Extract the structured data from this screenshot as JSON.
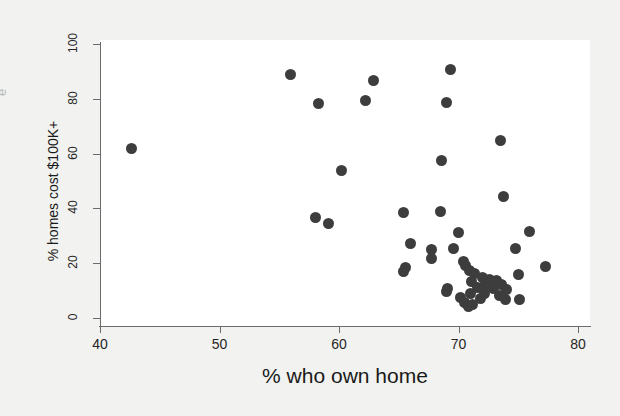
{
  "figure": {
    "clipped_left_text": "e",
    "background_color": "#f2f2f0",
    "plot_background_color": "#ffffff",
    "axis_color": "#6b6b6b",
    "marker_color": "#3d3d3d"
  },
  "chart_data": {
    "type": "scatter",
    "title": "",
    "xlabel": "% who own home",
    "ylabel": "% homes cost $100K+",
    "xlim": [
      40,
      80
    ],
    "ylim": [
      0,
      100
    ],
    "xticks": [
      40,
      50,
      60,
      70,
      80
    ],
    "yticks": [
      0,
      20,
      40,
      60,
      80,
      100
    ],
    "grid": false,
    "legend": "none",
    "marker": "filled-circle",
    "n_points": 51,
    "points": [
      {
        "x": 42.6,
        "y": 61.8
      },
      {
        "x": 55.9,
        "y": 88.7
      },
      {
        "x": 58.3,
        "y": 78.3
      },
      {
        "x": 62.2,
        "y": 79.2
      },
      {
        "x": 62.9,
        "y": 86.8
      },
      {
        "x": 69.3,
        "y": 90.8
      },
      {
        "x": 69.0,
        "y": 78.6
      },
      {
        "x": 73.5,
        "y": 64.7
      },
      {
        "x": 68.6,
        "y": 57.4
      },
      {
        "x": 60.2,
        "y": 53.9
      },
      {
        "x": 73.8,
        "y": 44.2
      },
      {
        "x": 65.4,
        "y": 38.5
      },
      {
        "x": 68.5,
        "y": 38.7
      },
      {
        "x": 58.0,
        "y": 36.6
      },
      {
        "x": 59.1,
        "y": 34.6
      },
      {
        "x": 70.0,
        "y": 31.3
      },
      {
        "x": 75.9,
        "y": 31.5
      },
      {
        "x": 66.0,
        "y": 27.2
      },
      {
        "x": 69.6,
        "y": 25.3
      },
      {
        "x": 67.7,
        "y": 25.0
      },
      {
        "x": 74.8,
        "y": 25.2
      },
      {
        "x": 67.7,
        "y": 21.8
      },
      {
        "x": 70.4,
        "y": 20.7
      },
      {
        "x": 70.6,
        "y": 19.2
      },
      {
        "x": 65.6,
        "y": 18.6
      },
      {
        "x": 77.3,
        "y": 18.7
      },
      {
        "x": 65.4,
        "y": 17.1
      },
      {
        "x": 70.9,
        "y": 17.3
      },
      {
        "x": 71.3,
        "y": 16.4
      },
      {
        "x": 75.0,
        "y": 15.8
      },
      {
        "x": 72.0,
        "y": 14.6
      },
      {
        "x": 72.6,
        "y": 14.0
      },
      {
        "x": 73.2,
        "y": 13.8
      },
      {
        "x": 71.1,
        "y": 13.2
      },
      {
        "x": 72.3,
        "y": 12.2
      },
      {
        "x": 73.6,
        "y": 12.1
      },
      {
        "x": 69.1,
        "y": 10.9
      },
      {
        "x": 71.6,
        "y": 11.2
      },
      {
        "x": 72.9,
        "y": 10.6
      },
      {
        "x": 74.0,
        "y": 10.4
      },
      {
        "x": 69.0,
        "y": 9.5
      },
      {
        "x": 71.0,
        "y": 9.0
      },
      {
        "x": 72.2,
        "y": 8.8
      },
      {
        "x": 73.4,
        "y": 8.1
      },
      {
        "x": 70.2,
        "y": 7.5
      },
      {
        "x": 71.8,
        "y": 7.2
      },
      {
        "x": 73.9,
        "y": 6.7
      },
      {
        "x": 75.1,
        "y": 6.6
      },
      {
        "x": 70.5,
        "y": 5.6
      },
      {
        "x": 71.2,
        "y": 4.8
      },
      {
        "x": 70.8,
        "y": 4.3
      }
    ]
  }
}
